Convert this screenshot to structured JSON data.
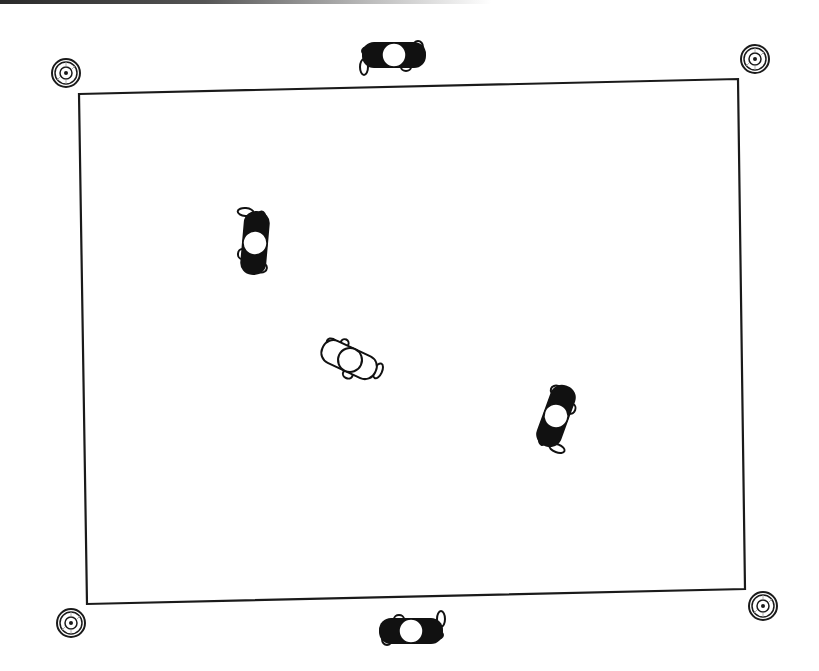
{
  "diagram": {
    "type": "field-layout",
    "colors": {
      "line": "#1a1a1a",
      "fill_dark": "#111111",
      "fill_light": "#ffffff",
      "background": "#ffffff"
    },
    "field": {
      "corners": [
        [
          79,
          94
        ],
        [
          738,
          79
        ],
        [
          745,
          589
        ],
        [
          87,
          604
        ]
      ]
    },
    "corner_markers": [
      {
        "id": "top-left",
        "cx": 66,
        "cy": 73
      },
      {
        "id": "top-right",
        "cx": 755,
        "cy": 59
      },
      {
        "id": "bottom-left",
        "cx": 71,
        "cy": 623
      },
      {
        "id": "bottom-right",
        "cx": 763,
        "cy": 606
      }
    ],
    "players": [
      {
        "id": "top",
        "team": "dark",
        "cx": 394,
        "cy": 55,
        "rotation": 0
      },
      {
        "id": "left",
        "team": "dark",
        "cx": 255,
        "cy": 243,
        "rotation": 95
      },
      {
        "id": "center",
        "team": "light",
        "cx": 350,
        "cy": 360,
        "rotation": 25
      },
      {
        "id": "right",
        "team": "dark",
        "cx": 556,
        "cy": 416,
        "rotation": -70
      },
      {
        "id": "bottom",
        "team": "dark",
        "cx": 411,
        "cy": 631,
        "rotation": 180
      }
    ]
  }
}
